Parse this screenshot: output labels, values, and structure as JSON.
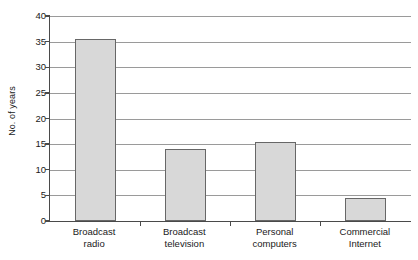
{
  "chart_data": {
    "type": "bar",
    "title": "",
    "xlabel": "",
    "ylabel": "No. of years",
    "categories": [
      "Broadcast radio",
      "Broadcast television",
      "Personal computers",
      "Commercial Internet"
    ],
    "category_lines": [
      [
        "Broadcast",
        "radio"
      ],
      [
        "Broadcast",
        "television"
      ],
      [
        "Personal",
        "computers"
      ],
      [
        "Commercial",
        "Internet"
      ]
    ],
    "values": [
      35.6,
      14.1,
      15.5,
      4.4
    ],
    "ylim": [
      0,
      40
    ],
    "ytick_values": [
      0,
      5,
      10,
      15,
      20,
      25,
      30,
      35,
      40
    ],
    "ytick_labels": [
      "0",
      "5",
      "10",
      "15",
      "20",
      "25",
      "30",
      "35",
      "40"
    ],
    "grid": true,
    "grid_axis": "y",
    "legend": false,
    "legend_position": "none",
    "bar_fill_color": "#d8d8d8",
    "bar_edge_color": "#676767",
    "grid_color": "#9a9a9a",
    "axis_color": "#4a4a4a",
    "background_color": "#ffffff"
  }
}
